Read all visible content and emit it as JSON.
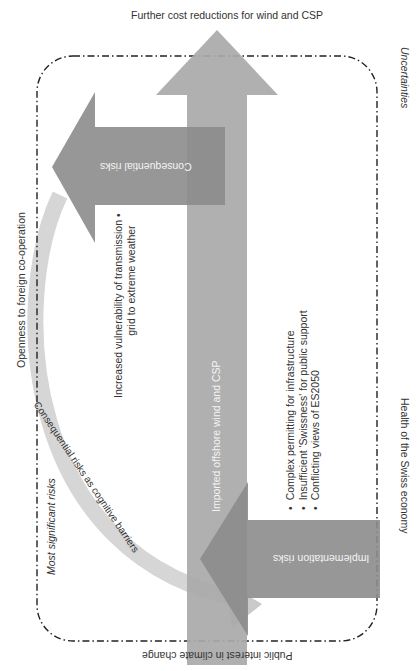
{
  "diagram": {
    "top_label": "Further cost reductions for wind and CSP",
    "bottom_label": "Public interest in climate change",
    "left_label": "Openness to foreign co-operation",
    "right_label_top": "Uncertainties",
    "right_label_bottom": "Health of the Swiss economy",
    "main_arrow": {
      "label": "Imported offshore wind and CSP",
      "direction": "up",
      "color": "#a9a9a9"
    },
    "consequential_arrow": {
      "label": "Consequential risks",
      "direction": "left",
      "color": "#8c8c8c"
    },
    "implementation_arrow": {
      "label": "Implementation risks",
      "direction": "left",
      "color": "#8c8c8c"
    },
    "curved_arrow": {
      "label": "Consequential risks as cognitive barriers",
      "color": "#d0d0d0"
    },
    "boundary": {
      "label": "Most significant risks",
      "style": "dash-dot"
    },
    "consequential_bullets": [
      "Increased vulnerability of transmission grid to extreme weather"
    ],
    "consequential_bullet_lines": [
      "Increased vulnerability of transmission",
      "grid to extreme weather"
    ],
    "implementation_bullets": [
      "Complex permitting for infrastructure",
      "Insufficient 'Swissness' for public support",
      "Conflicting views of ES2050"
    ]
  }
}
